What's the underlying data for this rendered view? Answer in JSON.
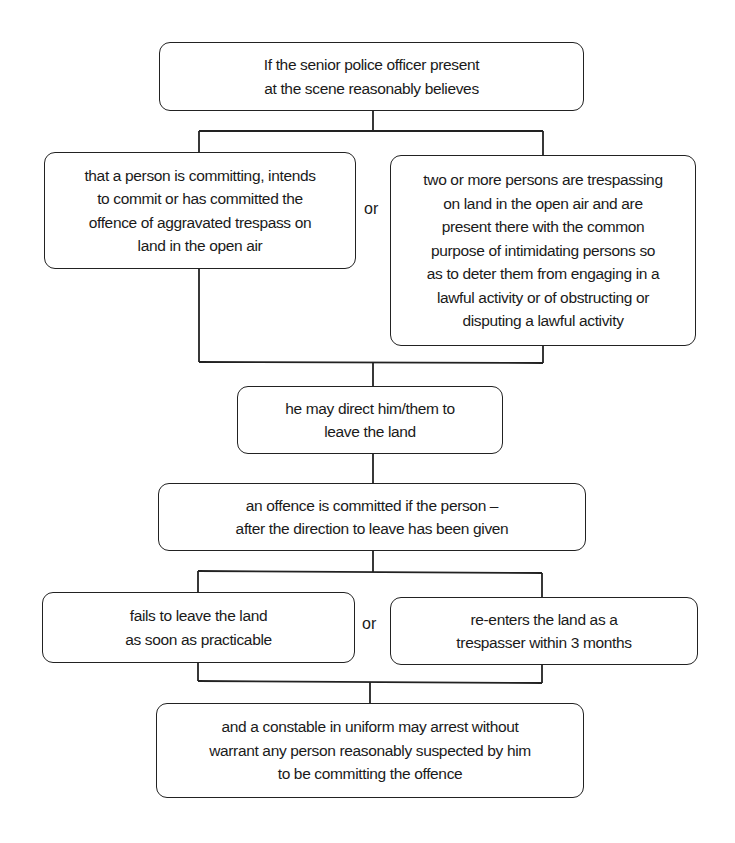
{
  "diagram": {
    "type": "flowchart",
    "nodes": {
      "condition": {
        "text": "If the senior police officer present\nat the scene reasonably believes"
      },
      "belief_a": {
        "text": "that a person is committing, intends\nto commit or has committed the\noffence of aggravated trespass on\nland in the open air"
      },
      "belief_b": {
        "text": "two or more persons are trespassing\non land in the open air and are\npresent there with the common\npurpose of intimidating persons so\nas to deter them from engaging in a\nlawful activity or of obstructing or\ndisputing a lawful activity"
      },
      "direction": {
        "text": "he may direct him/them to\nleave the land"
      },
      "offence": {
        "text": "an offence is committed if the person –\nafter the direction to leave has been given"
      },
      "fail_leave": {
        "text": "fails to leave the land\nas soon as practicable"
      },
      "re_enter": {
        "text": "re-enters the land as a\ntrespasser within 3 months"
      },
      "arrest": {
        "text": "and a constable in uniform may arrest without\nwarrant any person reasonably suspected by him\nto be committing the offence"
      }
    },
    "connectors": {
      "or_1": "or",
      "or_2": "or"
    },
    "edges": [
      [
        "condition",
        "belief_a"
      ],
      [
        "condition",
        "belief_b"
      ],
      [
        "belief_a",
        "direction"
      ],
      [
        "belief_b",
        "direction"
      ],
      [
        "direction",
        "offence"
      ],
      [
        "offence",
        "fail_leave"
      ],
      [
        "offence",
        "re_enter"
      ],
      [
        "fail_leave",
        "arrest"
      ],
      [
        "re_enter",
        "arrest"
      ]
    ],
    "colors": {
      "stroke": "#222222",
      "background": "#ffffff",
      "text": "#1a1a1a"
    }
  }
}
